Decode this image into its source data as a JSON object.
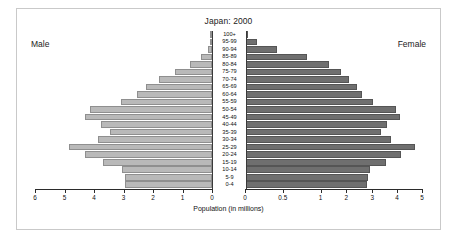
{
  "chart": {
    "title": "Japan: 2000",
    "male_label": "Male",
    "female_label": "Female",
    "xlabel": "Population (in millions)"
  },
  "chart_data": {
    "type": "bar",
    "subtype": "population-pyramid",
    "title": "Japan: 2000",
    "xlabel": "Population (in millions)",
    "ylabel": "",
    "grid": false,
    "legend": [
      "Male",
      "Female"
    ],
    "legend_position": "outside-top-corners",
    "categories": [
      "100+",
      "95-99",
      "90-94",
      "85-89",
      "80-84",
      "75-79",
      "70-74",
      "65-69",
      "60-64",
      "55-59",
      "50-54",
      "45-49",
      "40-44",
      "35-39",
      "30-34",
      "25-29",
      "20-24",
      "15-19",
      "10-14",
      "5-9",
      "0-4"
    ],
    "left_axis": {
      "label": "Male",
      "ticks": [
        6,
        5,
        4,
        3,
        2,
        1,
        0
      ],
      "ticklabels": [
        "6",
        "5",
        "4",
        "3",
        "2",
        "1",
        "0"
      ],
      "lim": [
        6,
        0
      ],
      "direction": "reversed"
    },
    "right_axis": {
      "label": "Female",
      "ticks": [
        0,
        0.5,
        1,
        2,
        3,
        4,
        5
      ],
      "ticklabels": [
        "0",
        "0.5",
        "1",
        "2",
        "3",
        "4",
        "5"
      ],
      "lim": [
        0,
        5
      ]
    },
    "series": [
      {
        "name": "Male",
        "side": "left",
        "color": "#b9b9b9",
        "values": [
          0.01,
          0.05,
          0.15,
          0.38,
          0.75,
          1.25,
          1.8,
          2.25,
          2.55,
          3.1,
          4.15,
          4.3,
          3.75,
          3.45,
          3.85,
          4.85,
          4.3,
          3.7,
          3.05,
          2.95,
          2.95
        ]
      },
      {
        "name": "Female",
        "side": "right",
        "color": "#6f6f6f",
        "values": [
          0.04,
          0.16,
          0.42,
          0.82,
          1.32,
          1.78,
          2.12,
          2.4,
          2.62,
          3.05,
          3.95,
          4.1,
          3.6,
          3.35,
          3.75,
          4.7,
          4.15,
          3.55,
          2.92,
          2.82,
          2.8
        ]
      }
    ]
  }
}
